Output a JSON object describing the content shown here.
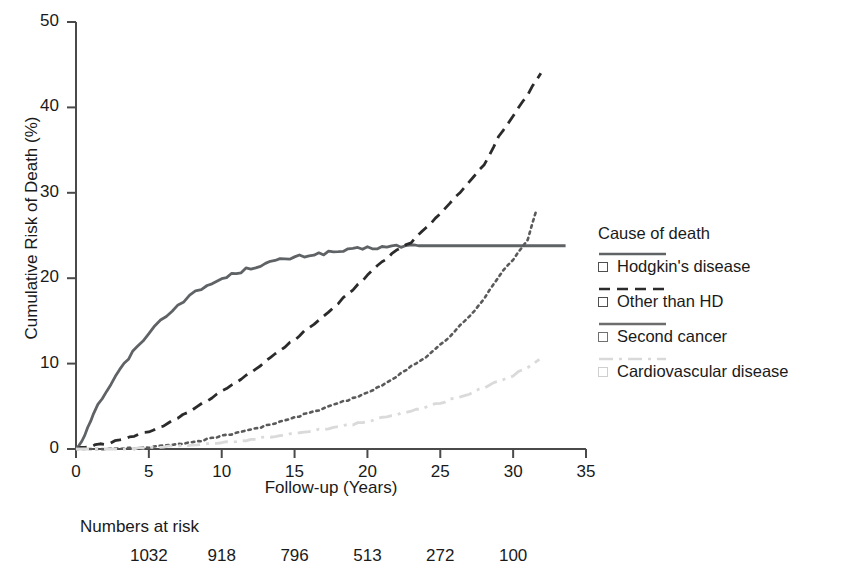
{
  "chart_data": {
    "type": "line",
    "title": "",
    "xlabel": "Follow-up (Years)",
    "ylabel": "Cumulative Risk of Death (%)",
    "xlim": [
      0,
      35
    ],
    "ylim": [
      0,
      50
    ],
    "xticks": [
      0,
      5,
      10,
      15,
      20,
      25,
      30,
      35
    ],
    "yticks": [
      0,
      10,
      20,
      30,
      40,
      50
    ],
    "grid": false,
    "legend_position": "right",
    "legend_title": "Cause of death",
    "series": [
      {
        "name": "Hodgkin's disease",
        "style": "solid",
        "color": "#5f6366",
        "x": [
          0,
          0.4,
          0.8,
          1.2,
          1.8,
          2.4,
          3.0,
          3.6,
          4.2,
          5.0,
          5.8,
          6.6,
          7.4,
          8.2,
          9.0,
          10.0,
          11.0,
          12.0,
          13.0,
          14.0,
          15.0,
          16.0,
          17.0,
          18.0,
          19.0,
          20.0,
          21.0,
          22.0,
          23.5,
          25.0,
          27.0,
          29.0,
          31.0,
          33.6
        ],
        "y": [
          0.0,
          1.0,
          2.5,
          4.2,
          6.0,
          7.6,
          9.2,
          10.6,
          12.0,
          13.6,
          15.0,
          16.3,
          17.4,
          18.3,
          19.1,
          19.9,
          20.6,
          21.2,
          21.7,
          22.1,
          22.4,
          22.7,
          22.9,
          23.1,
          23.3,
          23.5,
          23.6,
          23.7,
          23.8,
          23.8,
          23.8,
          23.8,
          23.8,
          23.8
        ]
      },
      {
        "name": "Other than HD",
        "style": "dashed",
        "color": "#2b2b2b",
        "x": [
          0,
          1.0,
          2.0,
          3.0,
          4.0,
          5.0,
          6.0,
          7.0,
          8.0,
          9.0,
          10.0,
          11.0,
          12.0,
          13.0,
          14.0,
          15.0,
          16.0,
          17.0,
          18.0,
          19.0,
          20.0,
          21.0,
          22.0,
          23.0,
          24.0,
          25.0,
          26.0,
          27.0,
          28.0,
          29.0,
          30.0,
          31.0,
          31.9
        ],
        "y": [
          0.0,
          0.3,
          0.6,
          1.0,
          1.5,
          2.0,
          2.7,
          3.6,
          4.6,
          5.6,
          6.7,
          7.8,
          9.0,
          10.2,
          11.5,
          12.8,
          14.2,
          15.6,
          17.1,
          18.7,
          20.3,
          21.9,
          23.2,
          24.2,
          25.8,
          27.6,
          29.4,
          31.2,
          33.3,
          36.5,
          39.0,
          41.5,
          44.0
        ]
      },
      {
        "name": "Second cancer",
        "style": "dotted",
        "color": "#5a5a5a",
        "x": [
          0,
          2.0,
          4.0,
          6.0,
          7.0,
          8.0,
          9.0,
          10.0,
          11.0,
          12.0,
          13.0,
          14.0,
          15.0,
          16.0,
          17.0,
          18.0,
          19.0,
          20.0,
          21.0,
          22.0,
          23.0,
          24.0,
          25.0,
          26.0,
          27.0,
          28.0,
          29.0,
          30.0,
          31.0,
          31.6
        ],
        "y": [
          0.0,
          0.0,
          0.1,
          0.3,
          0.5,
          0.8,
          1.1,
          1.5,
          1.9,
          2.3,
          2.7,
          3.2,
          3.7,
          4.2,
          4.7,
          5.3,
          5.9,
          6.6,
          7.5,
          8.5,
          9.6,
          10.8,
          12.2,
          13.8,
          15.5,
          17.5,
          20.2,
          22.2,
          24.5,
          28.0
        ]
      },
      {
        "name": "Cardiovascular disease",
        "style": "dashdot",
        "color": "#dadada",
        "x": [
          0,
          3.0,
          5.0,
          7.0,
          9.0,
          11.0,
          13.0,
          15.0,
          17.0,
          19.0,
          21.0,
          23.0,
          25.0,
          27.0,
          29.0,
          30.0,
          31.0,
          31.8
        ],
        "y": [
          0.0,
          0.0,
          0.1,
          0.3,
          0.6,
          0.9,
          1.3,
          1.8,
          2.3,
          2.9,
          3.6,
          4.4,
          5.4,
          6.5,
          7.9,
          8.6,
          9.6,
          10.5
        ]
      }
    ],
    "annotations": {
      "numbers_at_risk_label": "Numbers at risk",
      "numbers_at_risk": [
        {
          "x": 5,
          "value": "1032"
        },
        {
          "x": 10,
          "value": "918"
        },
        {
          "x": 15,
          "value": "796"
        },
        {
          "x": 20,
          "value": "513"
        },
        {
          "x": 25,
          "value": "272"
        },
        {
          "x": 30,
          "value": "100"
        }
      ]
    }
  },
  "axes": {
    "ylabel": "Cumulative Risk of Death (%)",
    "xlabel": "Follow-up (Years)",
    "ytick_labels": [
      "50",
      "40",
      "30",
      "20",
      "10",
      "0"
    ],
    "xtick_labels": [
      "0",
      "5",
      "10",
      "15",
      "20",
      "25",
      "30",
      "35"
    ]
  },
  "legend": {
    "title": "Cause of death",
    "entries": [
      {
        "label": "Hodgkin's disease",
        "style": "solid",
        "color": "#5f6366"
      },
      {
        "label": "Other than HD",
        "style": "dashed",
        "color": "#2b2b2b"
      },
      {
        "label": "Second cancer",
        "style": "solid",
        "color": "#6d6d6d"
      },
      {
        "label": "Cardiovascular disease",
        "style": "dashdot",
        "color": "#d9d9d9"
      }
    ]
  },
  "risk_table": {
    "label": "Numbers at risk",
    "values": [
      "1032",
      "918",
      "796",
      "513",
      "272",
      "100"
    ]
  }
}
